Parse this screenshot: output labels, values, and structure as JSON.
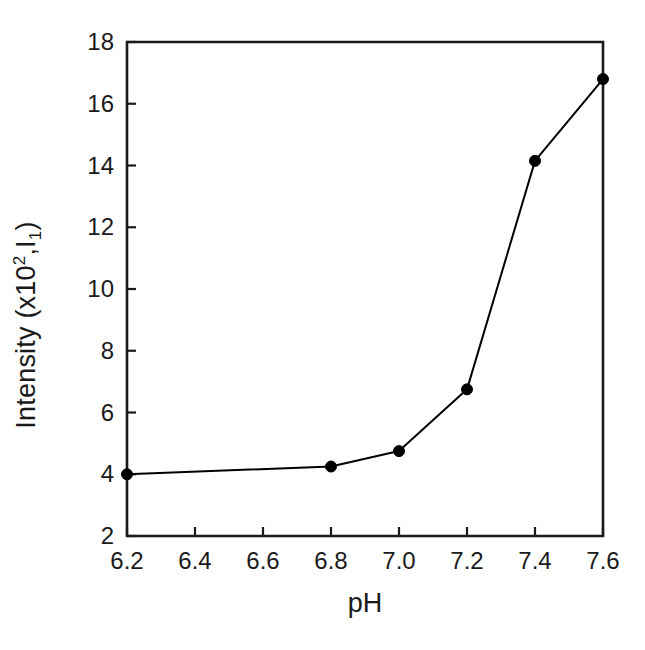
{
  "chart_data": {
    "type": "line",
    "title": "",
    "subtitle": "",
    "xlabel": "pH",
    "ylabel_plain": "Intensity (x10²,I₁)",
    "ylabel_parts": {
      "prefix": "Intensity (x10",
      "superscript": "2",
      "middle": ",I",
      "subscript": "1",
      "suffix": ")"
    },
    "x": [
      6.2,
      6.8,
      7.0,
      7.2,
      7.4,
      7.6
    ],
    "values": [
      4.0,
      4.25,
      4.75,
      6.75,
      14.15,
      16.8
    ],
    "series": [
      {
        "name": "Intensity vs pH",
        "x": [
          6.2,
          6.8,
          7.0,
          7.2,
          7.4,
          7.6
        ],
        "values": [
          4.0,
          4.25,
          4.75,
          6.75,
          14.15,
          16.8
        ]
      }
    ],
    "xlim": [
      6.2,
      7.6
    ],
    "ylim": [
      2,
      18
    ],
    "xticks": [
      6.2,
      6.4,
      6.6,
      6.8,
      7.0,
      7.2,
      7.4,
      7.6
    ],
    "xtick_labels": [
      "6.2",
      "6.4",
      "6.6",
      "6.8",
      "7.0",
      "7.2",
      "7.4",
      "7.6"
    ],
    "yticks": [
      2,
      4,
      6,
      8,
      10,
      12,
      14,
      16,
      18
    ],
    "ytick_labels": [
      "2",
      "4",
      "6",
      "8",
      "10",
      "12",
      "14",
      "16",
      "18"
    ],
    "grid": false,
    "legend": null,
    "legend_position": "none",
    "marker": "filled-circle",
    "marker_size_px": 11,
    "line_width_px": 2,
    "series_color": "#000000",
    "axis_color": "#1a1a1a",
    "background_color": "#ffffff",
    "annotations": []
  },
  "figure": {
    "plot_area": {
      "left": 127,
      "top": 42,
      "right": 603,
      "bottom": 536
    }
  }
}
